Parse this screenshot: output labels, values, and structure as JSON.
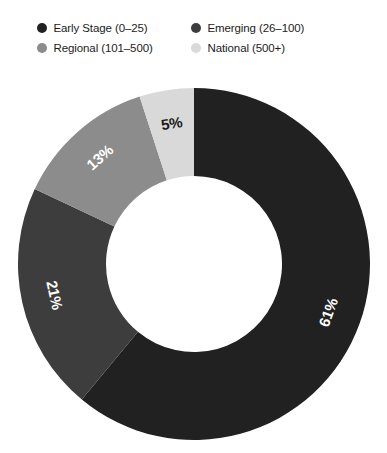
{
  "chart_data": {
    "type": "pie",
    "variant": "donut",
    "title": "",
    "subtitle": "",
    "xlabel": "",
    "ylabel": "",
    "legend_position": "top",
    "grid": false,
    "start_angle_deg": 0,
    "direction": "clockwise",
    "inner_radius_ratio": 0.5,
    "categories": [
      "Early Stage (0–25)",
      "Emerging (26–100)",
      "Regional (101–500)",
      "National (500+)"
    ],
    "values": [
      61,
      21,
      13,
      5
    ],
    "value_labels": [
      "61%",
      "21%",
      "13%",
      "5%"
    ],
    "colors": [
      "#212121",
      "#3d3d3d",
      "#8c8c8c",
      "#d9d9d9"
    ],
    "label_colors": [
      "#ffffff",
      "#ffffff",
      "#ffffff",
      "#1a1a1a"
    ],
    "units": "percent"
  },
  "legend": {
    "items": [
      {
        "label": "Early Stage (0–25)",
        "color": "#212121",
        "swatch_icon": "circle-swatch-icon"
      },
      {
        "label": "Emerging (26–100)",
        "color": "#3d3d3d",
        "swatch_icon": "circle-swatch-icon"
      },
      {
        "label": "Regional (101–500)",
        "color": "#8c8c8c",
        "swatch_icon": "circle-swatch-icon"
      },
      {
        "label": "National (500+)",
        "color": "#d9d9d9",
        "swatch_icon": "circle-swatch-icon"
      }
    ]
  },
  "canvas": {
    "background": "#ffffff"
  }
}
